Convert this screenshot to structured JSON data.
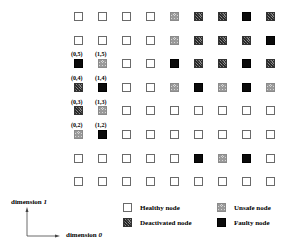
{
  "diagram": {
    "type": "mesh-node-status-grid",
    "columns": 9,
    "rows": 8,
    "grid_rows_top_to_bottom": [
      [
        "healthy",
        "healthy",
        "healthy",
        "healthy",
        "unsafe",
        "deactivated",
        "deactivated",
        "faulty",
        "deactivated"
      ],
      [
        "healthy",
        "healthy",
        "healthy",
        "healthy",
        "unsafe",
        "deactivated",
        "deactivated",
        "deactivated",
        "faulty"
      ],
      [
        "faulty",
        "unsafe",
        "healthy",
        "healthy",
        "faulty",
        "deactivated",
        "deactivated",
        "faulty",
        "deactivated"
      ],
      [
        "deactivated",
        "faulty",
        "healthy",
        "healthy",
        "unsafe",
        "faulty",
        "unsafe",
        "faulty",
        "unsafe"
      ],
      [
        "deactivated",
        "unsafe",
        "healthy",
        "healthy",
        "healthy",
        "healthy",
        "healthy",
        "healthy",
        "healthy"
      ],
      [
        "unsafe",
        "faulty",
        "healthy",
        "healthy",
        "healthy",
        "healthy",
        "healthy",
        "healthy",
        "healthy"
      ],
      [
        "healthy",
        "healthy",
        "healthy",
        "healthy",
        "healthy",
        "faulty",
        "unsafe",
        "faulty",
        "healthy"
      ],
      [
        "healthy",
        "healthy",
        "healthy",
        "healthy",
        "healthy",
        "healthy",
        "healthy",
        "healthy",
        "healthy"
      ]
    ],
    "coordinate_labels": [
      {
        "text": "(0,5)",
        "col": 0,
        "row_from_top": 2
      },
      {
        "text": "(1,5)",
        "col": 1,
        "row_from_top": 2
      },
      {
        "text": "(0,4)",
        "col": 0,
        "row_from_top": 3
      },
      {
        "text": "(1,4)",
        "col": 1,
        "row_from_top": 3
      },
      {
        "text": "(0,3)",
        "col": 0,
        "row_from_top": 4
      },
      {
        "text": "(1,3)",
        "col": 1,
        "row_from_top": 4
      },
      {
        "text": "(0,2)",
        "col": 0,
        "row_from_top": 5
      },
      {
        "text": "(1,2)",
        "col": 1,
        "row_from_top": 5
      }
    ]
  },
  "axes": {
    "dimension_1": {
      "label": "dimension",
      "index": "1"
    },
    "dimension_0": {
      "label": "dimension",
      "index": "0"
    }
  },
  "legend": {
    "healthy": "Healthy node",
    "unsafe": "Unsafe node",
    "deactivated": "Deactivated node",
    "faulty": "Faulty node"
  }
}
